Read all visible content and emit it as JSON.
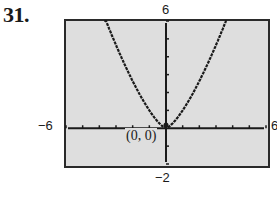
{
  "problem": {
    "number": "31."
  },
  "colors": {
    "screen_bg": "#dedede",
    "frame": "#2a2a2a",
    "curve": "#1a1a1a",
    "page_bg": "#ffffff"
  },
  "labels": {
    "ymax": "6",
    "ymin": "−2",
    "xmin": "−6",
    "xmax": "6",
    "origin": "(0, 0)"
  },
  "chart_data": {
    "type": "line",
    "title": "",
    "xlabel": "",
    "ylabel": "",
    "xlim": [
      -6,
      6
    ],
    "ylim": [
      -2,
      6
    ],
    "xtick_step": 1,
    "ytick_step": 1,
    "grid": false,
    "tick_labels": {
      "x": [
        "-6",
        "6"
      ],
      "y": [
        "-2",
        "6"
      ]
    },
    "annotations": [
      {
        "text": "(0, 0)",
        "x": 0,
        "y": 0
      }
    ],
    "series": [
      {
        "name": "curve",
        "x": [
          -3.7,
          -3,
          -2,
          -1,
          0,
          1,
          2,
          3,
          3.7
        ],
        "y": [
          6.2,
          4.7,
          2.6,
          1.0,
          0,
          1.0,
          2.6,
          4.7,
          6.2
        ]
      }
    ]
  }
}
